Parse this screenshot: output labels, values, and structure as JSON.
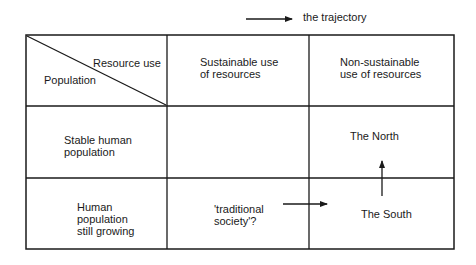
{
  "legend": {
    "icon": "arrow-right-icon",
    "label": "the trajectory"
  },
  "table": {
    "header": {
      "corner": {
        "column_axis_label": "Resource use",
        "row_axis_label": "Population"
      },
      "columns": [
        "Sustainable use\nof resources",
        "Non-sustainable\nuse of resources"
      ]
    },
    "rows": [
      {
        "label": "Stable human\npopulation",
        "cells": [
          "",
          "The North"
        ]
      },
      {
        "label": "Human\npopulation\nstill growing",
        "cells": [
          "'traditional\nsociety'?",
          "The South"
        ]
      }
    ]
  },
  "arrows": [
    {
      "from": "'traditional society'?",
      "to": "The South",
      "direction": "right"
    },
    {
      "from": "The South",
      "to": "The North",
      "direction": "up"
    }
  ],
  "colors": {
    "line": "#1a1a1a",
    "background": "#ffffff"
  }
}
